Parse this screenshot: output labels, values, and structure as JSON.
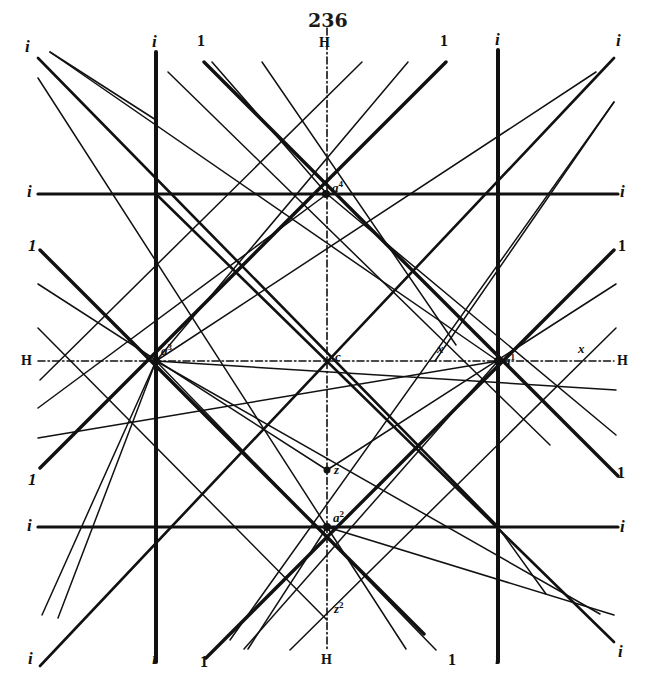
{
  "page": {
    "number": "236"
  },
  "figure": {
    "colors": {
      "ink": "#111111",
      "paper": "#ffffff"
    },
    "thick_lines": [
      {
        "name": "vertical-i-left",
        "x1": 156,
        "y1": 52,
        "x2": 156,
        "y2": 662,
        "w": 4
      },
      {
        "name": "vertical-i-right",
        "x1": 498,
        "y1": 50,
        "x2": 498,
        "y2": 662,
        "w": 4
      },
      {
        "name": "horizontal-i-top",
        "x1": 38,
        "y1": 194,
        "x2": 618,
        "y2": 194,
        "w": 3.2
      },
      {
        "name": "horizontal-i-bottom",
        "x1": 38,
        "y1": 527,
        "x2": 618,
        "y2": 527,
        "w": 3.2
      },
      {
        "name": "diag-1-topleft",
        "x1": 204,
        "y1": 62,
        "x2": 618,
        "y2": 476,
        "w": 3.4
      },
      {
        "name": "diag-1-topright",
        "x1": 446,
        "y1": 62,
        "x2": 40,
        "y2": 468,
        "w": 3.4
      },
      {
        "name": "diag-1-left",
        "x1": 40,
        "y1": 250,
        "x2": 424,
        "y2": 634,
        "w": 3.4
      },
      {
        "name": "diag-1-right",
        "x1": 614,
        "y1": 250,
        "x2": 206,
        "y2": 658,
        "w": 3.4
      },
      {
        "name": "diag-i-topleft-corner",
        "x1": 38,
        "y1": 58,
        "x2": 498,
        "y2": 527,
        "w": 2.6
      },
      {
        "name": "diag-i-topright-corner",
        "x1": 614,
        "y1": 58,
        "x2": 40,
        "y2": 666,
        "w": 2.6
      },
      {
        "name": "diag-i-bottomright-corner",
        "x1": 156,
        "y1": 194,
        "x2": 614,
        "y2": 642,
        "w": 2.6
      }
    ],
    "thin_lines": [
      {
        "x1": 50,
        "y1": 52,
        "x2": 498,
        "y2": 361
      },
      {
        "x1": 50,
        "y1": 52,
        "x2": 156,
        "y2": 120
      },
      {
        "x1": 38,
        "y1": 78,
        "x2": 327,
        "y2": 527
      },
      {
        "x1": 327,
        "y1": 527,
        "x2": 614,
        "y2": 615
      },
      {
        "x1": 156,
        "y1": 361,
        "x2": 600,
        "y2": 614
      },
      {
        "x1": 168,
        "y1": 72,
        "x2": 550,
        "y2": 445
      },
      {
        "x1": 212,
        "y1": 62,
        "x2": 327,
        "y2": 194
      },
      {
        "x1": 262,
        "y1": 62,
        "x2": 456,
        "y2": 345
      },
      {
        "x1": 362,
        "y1": 62,
        "x2": 40,
        "y2": 380
      },
      {
        "x1": 408,
        "y1": 62,
        "x2": 156,
        "y2": 361
      },
      {
        "x1": 596,
        "y1": 72,
        "x2": 156,
        "y2": 361
      },
      {
        "x1": 614,
        "y1": 102,
        "x2": 435,
        "y2": 361
      },
      {
        "x1": 614,
        "y1": 102,
        "x2": 230,
        "y2": 640
      },
      {
        "x1": 38,
        "y1": 284,
        "x2": 327,
        "y2": 470
      },
      {
        "x1": 38,
        "y1": 328,
        "x2": 327,
        "y2": 620
      },
      {
        "x1": 38,
        "y1": 408,
        "x2": 327,
        "y2": 194
      },
      {
        "x1": 38,
        "y1": 438,
        "x2": 498,
        "y2": 361
      },
      {
        "x1": 616,
        "y1": 284,
        "x2": 327,
        "y2": 470
      },
      {
        "x1": 616,
        "y1": 328,
        "x2": 290,
        "y2": 650
      },
      {
        "x1": 616,
        "y1": 390,
        "x2": 156,
        "y2": 361
      },
      {
        "x1": 616,
        "y1": 435,
        "x2": 327,
        "y2": 194
      },
      {
        "x1": 156,
        "y1": 361,
        "x2": 436,
        "y2": 650
      },
      {
        "x1": 498,
        "y1": 361,
        "x2": 244,
        "y2": 649
      },
      {
        "x1": 327,
        "y1": 527,
        "x2": 248,
        "y2": 649
      },
      {
        "x1": 327,
        "y1": 527,
        "x2": 406,
        "y2": 649
      },
      {
        "x1": 498,
        "y1": 527,
        "x2": 546,
        "y2": 594
      },
      {
        "x1": 156,
        "y1": 361,
        "x2": 58,
        "y2": 618
      },
      {
        "x1": 156,
        "y1": 361,
        "x2": 42,
        "y2": 615
      }
    ],
    "axis_lines": [
      {
        "name": "H-vertical",
        "x1": 327,
        "y1": 28,
        "x2": 327,
        "y2": 650
      },
      {
        "name": "H-horizontal",
        "x1": 38,
        "y1": 361,
        "x2": 614,
        "y2": 361
      }
    ],
    "points": [
      {
        "name": "a4",
        "x": 326,
        "y": 194,
        "r": 4
      },
      {
        "name": "a2",
        "x": 327,
        "y": 527,
        "r": 4
      },
      {
        "name": "a3",
        "x": 156,
        "y": 361,
        "r": 4
      },
      {
        "name": "a1",
        "x": 498,
        "y": 361,
        "r": 4
      },
      {
        "name": "c",
        "x": 327,
        "y": 361,
        "r": 2
      },
      {
        "name": "z",
        "x": 327,
        "y": 470,
        "r": 3.5
      }
    ],
    "labels": [
      {
        "id": "l-i-tl",
        "text": "i",
        "cls": "it",
        "x": 25,
        "y": 38
      },
      {
        "id": "l-i-tv",
        "text": "i",
        "cls": "it",
        "x": 152,
        "y": 33
      },
      {
        "id": "l-1-t1",
        "text": "1",
        "cls": "num",
        "x": 197,
        "y": 33
      },
      {
        "id": "l-H-top",
        "text": "H",
        "cls": "H",
        "x": 319,
        "y": 36
      },
      {
        "id": "l-1-t2",
        "text": "1",
        "cls": "num",
        "x": 440,
        "y": 33
      },
      {
        "id": "l-i-tv2",
        "text": "i",
        "cls": "it",
        "x": 495,
        "y": 31
      },
      {
        "id": "l-i-tr",
        "text": "i",
        "cls": "it",
        "x": 616,
        "y": 32
      },
      {
        "id": "l-i-ml",
        "text": "i",
        "cls": "it",
        "x": 27,
        "y": 183
      },
      {
        "id": "l-i-mr",
        "text": "i",
        "cls": "it",
        "x": 620,
        "y": 183
      },
      {
        "id": "l-1-l",
        "text": "1",
        "cls": "it",
        "x": 28,
        "y": 237
      },
      {
        "id": "l-1-r",
        "text": "1",
        "cls": "num",
        "x": 618,
        "y": 238
      },
      {
        "id": "l-H-l",
        "text": "H",
        "cls": "H",
        "x": 21,
        "y": 354
      },
      {
        "id": "l-H-r",
        "text": "H",
        "cls": "H",
        "x": 617,
        "y": 354
      },
      {
        "id": "l-1-bl",
        "text": "1",
        "cls": "it",
        "x": 28,
        "y": 471
      },
      {
        "id": "l-1-br",
        "text": "1",
        "cls": "num",
        "x": 617,
        "y": 465
      },
      {
        "id": "l-i-bl",
        "text": "i",
        "cls": "it",
        "x": 27,
        "y": 517
      },
      {
        "id": "l-i-br",
        "text": "i",
        "cls": "it",
        "x": 620,
        "y": 518
      },
      {
        "id": "l-i-bbl",
        "text": "i",
        "cls": "it",
        "x": 28,
        "y": 650
      },
      {
        "id": "l-i-bv",
        "text": "i",
        "cls": "it",
        "x": 152,
        "y": 650
      },
      {
        "id": "l-1-b1",
        "text": "1",
        "cls": "num",
        "x": 200,
        "y": 654
      },
      {
        "id": "l-H-bot",
        "text": "H",
        "cls": "H",
        "x": 321,
        "y": 653
      },
      {
        "id": "l-1-b2",
        "text": "1",
        "cls": "num",
        "x": 448,
        "y": 652
      },
      {
        "id": "l-i-bv2",
        "text": "i",
        "cls": "it",
        "x": 495,
        "y": 650
      },
      {
        "id": "l-i-bbr",
        "text": "i",
        "cls": "it",
        "x": 618,
        "y": 643
      },
      {
        "id": "l-a4",
        "text": "a",
        "sup": "4",
        "cls": "pt",
        "x": 332,
        "y": 180
      },
      {
        "id": "l-a3",
        "text": "a",
        "sup": "3",
        "cls": "pt",
        "x": 161,
        "y": 343
      },
      {
        "id": "l-a1",
        "text": "a",
        "sup": "1",
        "cls": "pt",
        "x": 504,
        "y": 353
      },
      {
        "id": "l-a2",
        "text": "a",
        "sup": "2",
        "cls": "pt",
        "x": 333,
        "y": 510
      },
      {
        "id": "l-c",
        "text": "c",
        "cls": "pt",
        "x": 335,
        "y": 350
      },
      {
        "id": "l-x",
        "text": "x",
        "cls": "pt",
        "x": 437,
        "y": 342
      },
      {
        "id": "l-x2",
        "text": "x",
        "cls": "pt",
        "x": 578,
        "y": 342
      },
      {
        "id": "l-z",
        "text": "z",
        "cls": "pt",
        "x": 334,
        "y": 463
      },
      {
        "id": "l-z2",
        "text": "z",
        "sup": "2",
        "cls": "pt",
        "x": 334,
        "y": 601
      }
    ]
  }
}
